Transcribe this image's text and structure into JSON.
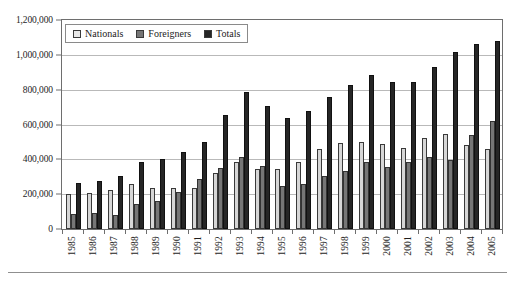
{
  "chart_data": {
    "type": "bar",
    "title": "",
    "subtitle": "",
    "xlabel": "",
    "ylabel": "",
    "ylim": [
      0,
      1200000
    ],
    "ytick_step": 200000,
    "grid": true,
    "legend_position": "top-left-inside",
    "categories": [
      "1985",
      "1986",
      "1987",
      "1988",
      "1989",
      "1990",
      "1991",
      "1992",
      "1993",
      "1994",
      "1995",
      "1996",
      "1997",
      "1998",
      "1999",
      "2000",
      "2001",
      "2002",
      "2003",
      "2004",
      "2005"
    ],
    "ytick_labels": [
      "0",
      "200,000",
      "400,000",
      "600,000",
      "800,000",
      "1,000,000",
      "1,200,000"
    ],
    "ytick_values": [
      0,
      200000,
      400000,
      600000,
      800000,
      1000000,
      1200000
    ],
    "series": [
      {
        "name": "Nationals",
        "color": "#d6d6d6",
        "values": [
          200000,
          205000,
          225000,
          258000,
          237000,
          237000,
          237000,
          320000,
          385000,
          345000,
          347000,
          383000,
          460000,
          493000,
          500000,
          488000,
          468000,
          520000,
          545000,
          485000,
          460000
        ]
      },
      {
        "name": "Foreigners",
        "color": "#767676",
        "values": [
          85000,
          92000,
          80000,
          145000,
          163000,
          213000,
          288000,
          352000,
          413000,
          362000,
          245000,
          258000,
          305000,
          335000,
          383000,
          355000,
          385000,
          413000,
          395000,
          540000,
          620000
        ]
      },
      {
        "name": "Totals",
        "color": "#262626",
        "values": [
          262000,
          273000,
          305000,
          383000,
          400000,
          443000,
          500000,
          653000,
          785000,
          705000,
          638000,
          675000,
          760000,
          828000,
          885000,
          843000,
          845000,
          930000,
          1015000,
          1060000,
          1080000
        ]
      }
    ]
  },
  "legend": {
    "entries": [
      {
        "label": "Nationals",
        "swatch": "nationals-swatch"
      },
      {
        "label": "Foreigners",
        "swatch": "foreigners-swatch"
      },
      {
        "label": "Totals",
        "swatch": "totals-swatch"
      }
    ]
  },
  "colors": {
    "nationals": "#d6d6d6",
    "foreigners": "#767676",
    "totals": "#262626",
    "gridline": "#b9b9b9",
    "axis": "#6e6e6e",
    "text": "#1d1d1d",
    "background": "#ffffff"
  }
}
